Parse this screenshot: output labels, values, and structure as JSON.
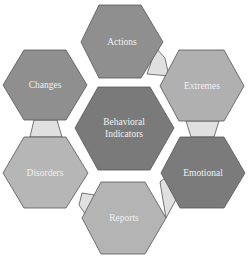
{
  "diagram": {
    "center": {
      "lines": [
        "Behavioral",
        "Indicators"
      ],
      "fill": "#7a7a7a"
    },
    "nodes": [
      {
        "label": "Actions",
        "fill": "#8f8f8f"
      },
      {
        "label": "Extremes",
        "fill": "#b0b0b0"
      },
      {
        "label": "Emotional",
        "fill": "#7b7b7b"
      },
      {
        "label": "Reports",
        "fill": "#b4b4b4"
      },
      {
        "label": "Disorders",
        "fill": "#b6b6b6"
      },
      {
        "label": "Changes",
        "fill": "#8f8f8f"
      }
    ],
    "connector_fill": "#e0e0e0"
  }
}
